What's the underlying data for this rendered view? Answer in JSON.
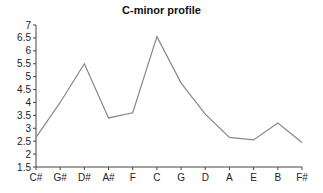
{
  "chart_data": {
    "type": "line",
    "title": "C-minor profile",
    "xlabel": "",
    "ylabel": "",
    "categories": [
      "C#",
      "G#",
      "D#",
      "A#",
      "F",
      "C",
      "G",
      "D",
      "A",
      "E",
      "B",
      "F#"
    ],
    "series": [
      {
        "name": "C-minor profile",
        "values": [
          2.65,
          4.0,
          5.5,
          3.4,
          3.6,
          6.55,
          4.75,
          3.55,
          2.65,
          2.55,
          3.2,
          2.45
        ],
        "color": "#888888"
      }
    ],
    "ylim": [
      1.5,
      7
    ],
    "yticks": [
      "1.5",
      "2",
      "2.5",
      "3",
      "3.5",
      "4",
      "4.5",
      "5",
      "5.5",
      "6",
      "6.5",
      "7"
    ],
    "grid": false,
    "legend": "none"
  }
}
